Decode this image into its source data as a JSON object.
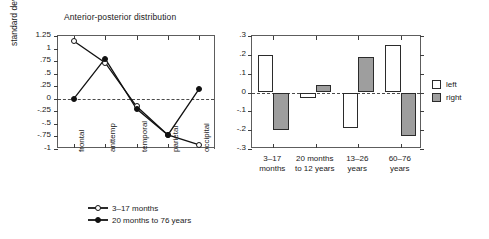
{
  "figure": {
    "background": "#ffffff",
    "line_color": "#111111",
    "bar_left_color": "#ffffff",
    "bar_right_color": "#9e9e9e",
    "axis_color": "#5d5d5d"
  },
  "chart_data": [
    {
      "type": "line",
      "title": "Anterior-posterior distribution",
      "xlabel": "",
      "ylabel": "standard deviations",
      "categories": [
        "frontal",
        "anttemp",
        "temporal",
        "parietal",
        "occipital"
      ],
      "ylim": [
        -1,
        1.25
      ],
      "yticks": [
        1.25,
        1,
        0.75,
        0.5,
        0.25,
        0,
        -0.25,
        -0.5,
        -0.75,
        -1
      ],
      "ytick_labels": [
        "1.25",
        "1",
        ".75",
        ".5",
        ".25",
        "0",
        "-.25",
        "-.5",
        "-.75",
        "-1"
      ],
      "grid": false,
      "zero_line": true,
      "legend_position": "below",
      "series": [
        {
          "name": "3-17 months",
          "marker": "open-circle",
          "values": [
            1.15,
            0.72,
            -0.15,
            -0.72,
            -0.92
          ]
        },
        {
          "name": "20 months to 76 years",
          "marker": "filled-circle",
          "values": [
            0.0,
            0.8,
            -0.2,
            -0.72,
            0.2
          ]
        }
      ]
    },
    {
      "type": "bar",
      "title": "Lateral distribution",
      "xlabel": "",
      "ylabel": "",
      "categories": [
        "3-17\nmonths",
        "20 months\nto 12 years",
        "13-26\nyears",
        "60-76\nyears"
      ],
      "category_lines": [
        [
          "3–17",
          "months"
        ],
        [
          "20 months",
          "to 12 years"
        ],
        [
          "13–26",
          "years"
        ],
        [
          "60–76",
          "years"
        ]
      ],
      "ylim": [
        -0.3,
        0.3
      ],
      "yticks": [
        0.3,
        0.2,
        0.1,
        0,
        -0.1,
        -0.2,
        -0.3
      ],
      "ytick_labels": [
        ".3",
        ".2",
        ".1",
        "0",
        "-.1",
        "-.2",
        "-.3"
      ],
      "grid": false,
      "zero_line": true,
      "legend_position": "right",
      "series": [
        {
          "name": "left",
          "color": "#ffffff",
          "values": [
            0.2,
            -0.03,
            -0.19,
            0.25
          ]
        },
        {
          "name": "right",
          "color": "#9e9e9e",
          "values": [
            -0.2,
            0.04,
            0.19,
            -0.23
          ]
        }
      ]
    }
  ],
  "ap_chart": {
    "title": "Anterior-posterior distribution",
    "y_axis_title": "standard deviations",
    "y_labels": [
      "1.25",
      "1",
      ".75",
      ".5",
      ".25",
      "0",
      "-.25",
      "-.5",
      "-.75",
      "-1"
    ],
    "x_labels": [
      "frontal",
      "anttemp",
      "temporal",
      "parietal",
      "occipital"
    ],
    "legend": [
      {
        "label": "3–17 months",
        "marker": "open-circle"
      },
      {
        "label": "20 months to 76 years",
        "marker": "filled-circle"
      }
    ]
  },
  "lat_chart": {
    "title": "Lateral distribution",
    "y_labels": [
      ".3",
      ".2",
      ".1",
      "0",
      "-.1",
      "-.2",
      "-.3"
    ],
    "x_groups": [
      {
        "line1": "3–17",
        "line2": "months"
      },
      {
        "line1": "20 months",
        "line2": "to 12 years"
      },
      {
        "line1": "13–26",
        "line2": "years"
      },
      {
        "line1": "60–76",
        "line2": "years"
      }
    ],
    "legend": [
      {
        "label": "left",
        "swatch": "white"
      },
      {
        "label": "right",
        "swatch": "gray"
      }
    ]
  }
}
